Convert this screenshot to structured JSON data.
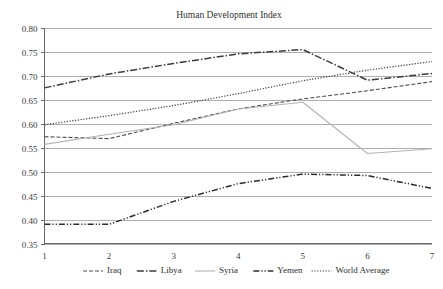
{
  "chart_data": {
    "type": "line",
    "title": "Human Development Index",
    "xlabel": "",
    "ylabel": "",
    "x": [
      1,
      2,
      3,
      4,
      5,
      6,
      7
    ],
    "xtick_labels": [
      "1",
      "2",
      "3",
      "4",
      "5",
      "6",
      "7"
    ],
    "ytick_labels": [
      "0.35",
      "0.40",
      "0.45",
      "0.50",
      "0.55",
      "0.60",
      "0.65",
      "0.70",
      "0.75",
      "0.80"
    ],
    "ytick_values": [
      0.35,
      0.4,
      0.45,
      0.5,
      0.55,
      0.6,
      0.65,
      0.7,
      0.75,
      0.8
    ],
    "xlim": [
      1,
      7
    ],
    "ylim": [
      0.35,
      0.8
    ],
    "grid": "horizontal",
    "legend_position": "bottom",
    "series": [
      {
        "name": "Iraq",
        "values": [
          0.573,
          0.569,
          0.601,
          0.631,
          0.652,
          0.669,
          0.688
        ],
        "style": "dashed",
        "color": "#4a4a4a",
        "width": 1.1,
        "dash": "4,2"
      },
      {
        "name": "Libya",
        "values": [
          0.675,
          0.704,
          0.726,
          0.746,
          0.755,
          0.691,
          0.705
        ],
        "style": "dash-dot",
        "color": "#3b3b3b",
        "width": 1.5,
        "dash": "7,2,1.5,2"
      },
      {
        "name": "Syria",
        "values": [
          0.557,
          0.578,
          0.598,
          0.631,
          0.645,
          0.538,
          0.548
        ],
        "style": "solid",
        "color": "#b3b3b3",
        "width": 1.1,
        "dash": "none"
      },
      {
        "name": "Yemen",
        "values": [
          0.39,
          0.39,
          0.438,
          0.475,
          0.495,
          0.492,
          0.465
        ],
        "style": "dash-dot-dot",
        "color": "#2b2b2b",
        "width": 1.5,
        "dash": "6,2,1.2,2,1.2,2"
      },
      {
        "name": "World Average",
        "values": [
          0.598,
          0.617,
          0.638,
          0.663,
          0.69,
          0.712,
          0.73
        ],
        "style": "dotted",
        "color": "#3a3a3a",
        "width": 1.2,
        "dash": "1.2,1.6"
      }
    ]
  },
  "legend": {
    "items": [
      {
        "label": "Iraq"
      },
      {
        "label": "Libya"
      },
      {
        "label": "Syria"
      },
      {
        "label": "Yemen"
      },
      {
        "label": "World Average"
      }
    ]
  },
  "colors": {
    "background": "#ffffff",
    "gridline": "#9a9a9a",
    "axis": "#6a6a6a",
    "text": "#3a3a3a"
  }
}
